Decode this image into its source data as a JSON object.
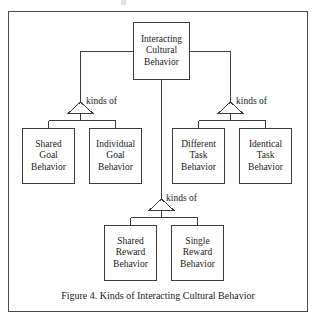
{
  "figure": {
    "caption": "Figure 4. Kinds of Interacting Cultural Behavior",
    "border_color": "#4a4a4a",
    "line_color": "#3c3c3c",
    "text_color": "#1a1a1a",
    "background": "#ffffff"
  },
  "nodes": {
    "root": {
      "name": "Interacting Cultural Behavior",
      "lines": [
        "Interacting",
        "Cultural",
        "Behavior"
      ]
    },
    "shared_goal": {
      "name": "Shared Goal Behavior",
      "lines": [
        "Shared",
        "Goal",
        "Behavior"
      ]
    },
    "individual_goal": {
      "name": "Individual Goal Behavior",
      "lines": [
        "Individual",
        "Goal",
        "Behavior"
      ]
    },
    "different_task": {
      "name": "Different Task Behavior",
      "lines": [
        "Different",
        "Task",
        "Behavior"
      ]
    },
    "identical_task": {
      "name": "Identical Task Behavior",
      "lines": [
        "Identical",
        "Task",
        "Behavior"
      ]
    },
    "shared_reward": {
      "name": "Shared Reward Behavior",
      "lines": [
        "Shared",
        "Reward",
        "Behavior"
      ]
    },
    "single_reward": {
      "name": "Single Reward Behavior",
      "lines": [
        "Single",
        "Reward",
        "Behavior"
      ]
    }
  },
  "relations": {
    "left": {
      "label": "kinds of"
    },
    "right": {
      "label": "kinds of"
    },
    "bottom": {
      "label": "kinds of"
    }
  }
}
